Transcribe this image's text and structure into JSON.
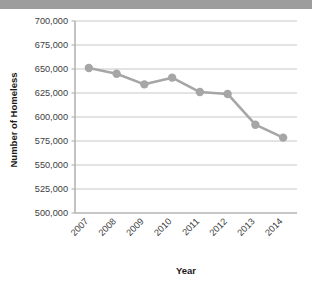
{
  "figure": {
    "background_color": "#ffffff",
    "top_band_color": "#9d9d9d"
  },
  "chart_data": {
    "type": "line",
    "title": "",
    "xlabel": "Year",
    "ylabel": "Number of Homeless",
    "categories": [
      "2007",
      "2008",
      "2009",
      "2010",
      "2011",
      "2012",
      "2013",
      "2014"
    ],
    "values": [
      651000,
      645000,
      634000,
      641000,
      626000,
      624000,
      592000,
      578500
    ],
    "series": [
      {
        "name": "Number of Homeless",
        "values": [
          651000,
          645000,
          634000,
          641000,
          626000,
          624000,
          592000,
          578500
        ],
        "color": "#a6a6a6",
        "marker": "circle"
      }
    ],
    "ylim": [
      500000,
      700000
    ],
    "ytick_values": [
      500000,
      525000,
      550000,
      575000,
      600000,
      625000,
      650000,
      675000,
      700000
    ],
    "ytick_labels": [
      "500,000",
      "525,000",
      "550,000",
      "575,000",
      "600,000",
      "625,000",
      "650,000",
      "675,000",
      "700,000"
    ],
    "xtick_labels": [
      "2007",
      "2008",
      "2009",
      "2010",
      "2011",
      "2012",
      "2013",
      "2014"
    ],
    "xtick_rotation": 45,
    "grid": {
      "horizontal": true,
      "vertical": false,
      "color": "#c8c8c8"
    },
    "legend": {
      "visible": false,
      "position": "none"
    },
    "line_color": "#a6a6a6",
    "line_width": 2.6,
    "marker_color": "#a6a6a6",
    "marker_size": 4.2,
    "axis_color": "#b4b4b4"
  }
}
